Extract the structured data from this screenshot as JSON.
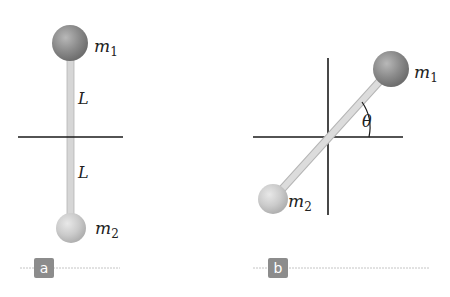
{
  "figure": {
    "panel_a": {
      "tag": "a",
      "mass_top": {
        "symbol": "m",
        "subscript": "1"
      },
      "mass_bottom": {
        "symbol": "m",
        "subscript": "2"
      },
      "length_top": "L",
      "length_bottom": "L"
    },
    "panel_b": {
      "tag": "b",
      "mass_top": {
        "symbol": "m",
        "subscript": "1"
      },
      "mass_bottom": {
        "symbol": "m",
        "subscript": "2"
      },
      "angle": "θ"
    },
    "colors": {
      "mass_1": "#8a8a8a",
      "mass_2": "#c9c9c9",
      "rod": "#d4d4d4",
      "axis": "#1a1a1a",
      "tag_bg": "#8c8c8c",
      "divider": "#bdbdbd"
    }
  }
}
